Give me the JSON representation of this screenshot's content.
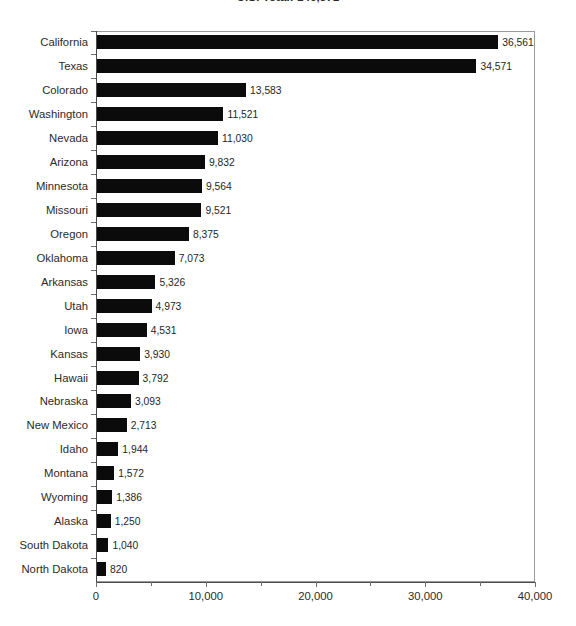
{
  "chart_data": {
    "type": "bar",
    "orientation": "horizontal",
    "title": "U.S. Total: 146,371",
    "xlabel": "",
    "ylabel": "",
    "xlim": [
      0,
      40000
    ],
    "xticks": [
      0,
      5000,
      10000,
      15000,
      20000,
      25000,
      30000,
      35000,
      40000
    ],
    "xtick_labels": [
      "0",
      "",
      "10,000",
      "",
      "20,000",
      "",
      "30,000",
      "",
      "40,000"
    ],
    "grid": false,
    "legend": false,
    "bar_color": "#0b0b0b",
    "categories": [
      "California",
      "Texas",
      "Colorado",
      "Washington",
      "Nevada",
      "Arizona",
      "Minnesota",
      "Missouri",
      "Oregon",
      "Oklahoma",
      "Arkansas",
      "Utah",
      "Iowa",
      "Kansas",
      "Hawaii",
      "Nebraska",
      "New Mexico",
      "Idaho",
      "Montana",
      "Wyoming",
      "Alaska",
      "South Dakota",
      "North Dakota"
    ],
    "values": [
      36561,
      34571,
      13583,
      11521,
      11030,
      9832,
      9564,
      9521,
      8375,
      7073,
      5326,
      4973,
      4531,
      3930,
      3792,
      3093,
      2713,
      1944,
      1572,
      1386,
      1250,
      1040,
      820
    ],
    "value_labels": [
      "36,561",
      "34,571",
      "13,583",
      "11,521",
      "11,030",
      "9,832",
      "9,564",
      "9,521",
      "8,375",
      "7,073",
      "5,326",
      "4,973",
      "4,531",
      "3,930",
      "3,792",
      "3,093",
      "2,713",
      "1,944",
      "1,572",
      "1,386",
      "1,250",
      "1,040",
      "820"
    ]
  }
}
